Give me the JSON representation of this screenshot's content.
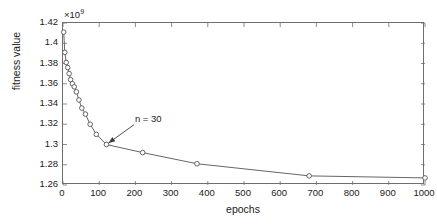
{
  "chart_data": {
    "type": "line",
    "title": "",
    "xlabel": "epochs",
    "ylabel": "fitness value",
    "y_multiplier": "×10",
    "y_multiplier_exponent": "9",
    "y_multiplier_value": 1000000000,
    "xlim": [
      0,
      1000
    ],
    "ylim": [
      1.26,
      1.42
    ],
    "xticks": [
      0,
      100,
      200,
      300,
      400,
      500,
      600,
      700,
      800,
      900,
      1000
    ],
    "xtick_labels": [
      "0",
      "100",
      "200",
      "300",
      "400",
      "500",
      "600",
      "700",
      "800",
      "900",
      "1000"
    ],
    "yticks": [
      1.26,
      1.28,
      1.3,
      1.32,
      1.34,
      1.36,
      1.38,
      1.4,
      1.42
    ],
    "ytick_labels": [
      "1.26",
      "1.28",
      "1.3",
      "1.32",
      "1.34",
      "1.36",
      "1.38",
      "1.4",
      "1.42"
    ],
    "grid": false,
    "legend": null,
    "marker": "circle",
    "line_color": "#555555",
    "marker_edge_color": "#555555",
    "marker_face_color": "#ffffff",
    "series": [
      {
        "name": "fitness value",
        "x": [
          2,
          5,
          9,
          13,
          17,
          21,
          26,
          31,
          37,
          44,
          52,
          62,
          75,
          92,
          120,
          220,
          370,
          680,
          1000
        ],
        "y": [
          1.411,
          1.391,
          1.381,
          1.376,
          1.37,
          1.364,
          1.36,
          1.357,
          1.352,
          1.344,
          1.336,
          1.33,
          1.32,
          1.31,
          1.3,
          1.292,
          1.281,
          1.269,
          1.267
        ]
      }
    ],
    "annotations": [
      {
        "text": "n = 30",
        "text_x": 196,
        "text_y": 1.3195,
        "target_x": 120,
        "target_y": 1.3,
        "arrow": true
      }
    ]
  }
}
